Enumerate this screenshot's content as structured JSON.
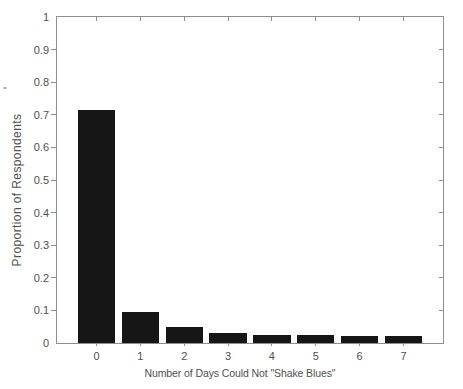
{
  "chart_data": {
    "type": "bar",
    "title": "",
    "xlabel": "Number of Days Could Not \"Shake Blues\"",
    "ylabel": "Proportion of Respondents",
    "categories": [
      "0",
      "1",
      "2",
      "3",
      "4",
      "5",
      "6",
      "7"
    ],
    "values": [
      0.715,
      0.095,
      0.048,
      0.03,
      0.025,
      0.025,
      0.022,
      0.02
    ],
    "ylim": [
      0,
      1
    ],
    "x_range": [
      -0.9,
      7.9
    ],
    "y_ticks": [
      0,
      0.1,
      0.2,
      0.3,
      0.4,
      0.5,
      0.6,
      0.7,
      0.8,
      0.9,
      1
    ],
    "y_tick_labels": [
      "0",
      "0.1",
      "0.2",
      "0.3",
      "0.4",
      "0.5",
      "0.6",
      "0.7",
      "0.8",
      "0.9",
      "1"
    ],
    "grid": false,
    "legend_position": "none",
    "bar_width_fraction": 0.85,
    "bar_color": "#161616",
    "axis_color": "#8e8e8e",
    "text_color": "#4f4f4f",
    "background_color": "#ffffff"
  }
}
